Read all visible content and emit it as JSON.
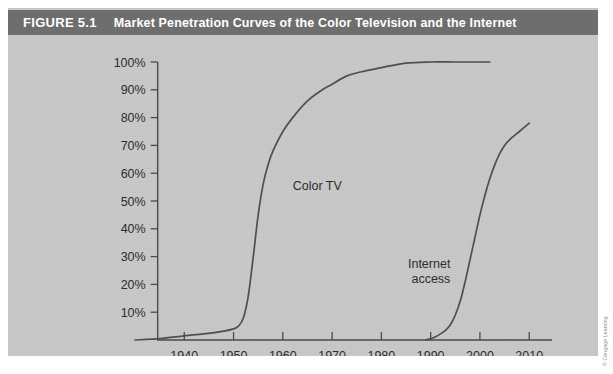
{
  "figure": {
    "number": "FIGURE 5.1",
    "title": "Market Penetration Curves of the Color Television and the Internet",
    "credit": "© Cengage Learning"
  },
  "colors": {
    "title_bar": "#6e6e6e",
    "panel": "#c9c9c9",
    "curve": "#4f4f4f",
    "axis": "#4a4a4a",
    "text": "#2d2d2d"
  },
  "chart_data": {
    "type": "line",
    "title": "Market Penetration Curves of the Color Television and the Internet",
    "xlabel": "",
    "ylabel": "",
    "xlim": [
      1930,
      2013
    ],
    "ylim": [
      0,
      100
    ],
    "grid": false,
    "legend": "inline-annotation",
    "xticks": [
      1940,
      1950,
      1960,
      1970,
      1980,
      1990,
      2000,
      2010
    ],
    "xticklabels": [
      "1940",
      "1950",
      "1960",
      "1970",
      "1980",
      "1990",
      "2000",
      "2010"
    ],
    "yticks": [
      10,
      20,
      30,
      40,
      50,
      60,
      70,
      80,
      90,
      100
    ],
    "yticklabels": [
      "10%",
      "20%",
      "30%",
      "40%",
      "50%",
      "60%",
      "70%",
      "80%",
      "90%",
      "100%"
    ],
    "series": [
      {
        "name": "Color TV",
        "label": "Color TV",
        "x": [
          1930,
          1935,
          1940,
          1944,
          1948,
          1950,
          1951,
          1952,
          1953,
          1954,
          1955,
          1956,
          1957,
          1958,
          1960,
          1962,
          1965,
          1968,
          1970,
          1973,
          1976,
          1980,
          1985,
          1990,
          1995,
          2000,
          2002
        ],
        "values": [
          0,
          0.5,
          1.5,
          2.2,
          3.2,
          4,
          5,
          8,
          16,
          30,
          45,
          56,
          63,
          68,
          75,
          80,
          86,
          90,
          92,
          95,
          96.5,
          98,
          99.6,
          100,
          100,
          100,
          100
        ]
      },
      {
        "name": "Internet access",
        "label": "Internet\naccess",
        "x": [
          1989,
          1990,
          1991,
          1992,
          1993,
          1994,
          1995,
          1996,
          1997,
          1998,
          1999,
          2000,
          2001,
          2002,
          2003,
          2004,
          2005,
          2006,
          2008,
          2010
        ],
        "values": [
          0,
          0.5,
          1.2,
          2.2,
          3.5,
          5.5,
          9,
          14,
          21,
          29,
          37,
          45,
          52,
          58,
          63,
          67,
          70,
          72,
          75,
          78
        ]
      }
    ],
    "annotations": [
      {
        "text": "Color TV",
        "x": 1962,
        "y": 54
      },
      {
        "text": "Internet access",
        "x": 1994,
        "y": 26
      }
    ]
  }
}
